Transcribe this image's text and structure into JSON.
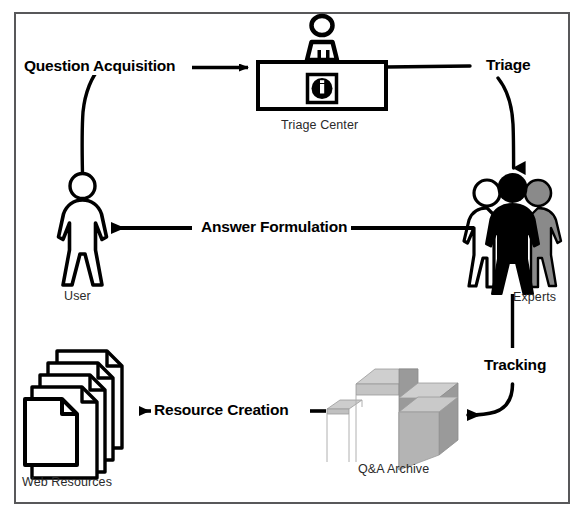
{
  "figure": {
    "border_color": "#58585a",
    "background": "#ffffff"
  },
  "nodes": [
    {
      "id": "triage-center",
      "label": "Triage Center",
      "icon": "information-desk-icon",
      "shape": "desk-with-attendant-and-info-symbol",
      "info_symbol": "i",
      "color": "#000000"
    },
    {
      "id": "experts",
      "label": "Experts",
      "icon": "three-people-icon",
      "shape": "three-person-figures",
      "colors": [
        "#ffffff",
        "#000000",
        "#808080"
      ]
    },
    {
      "id": "user",
      "label": "User",
      "icon": "person-icon",
      "shape": "single-person-figure",
      "color": "#ffffff"
    },
    {
      "id": "web-resources",
      "label": "Web Resources",
      "icon": "document-stack-icon",
      "shape": "stack-of-five-documents",
      "color": "#ffffff"
    },
    {
      "id": "qa-archive",
      "label": "Q&A Archive",
      "icon": "database-blocks-icon",
      "shape": "isometric-stair-blocks",
      "colors": [
        "#c9c9c9",
        "#9a9a9a",
        "#b5b5b5"
      ]
    }
  ],
  "edges": [
    {
      "id": "question-acquisition",
      "label": "Question Acquisition",
      "from": "user",
      "to": "triage-center",
      "arrow": "arrow-right"
    },
    {
      "id": "triage",
      "label": "Triage",
      "from": "triage-center",
      "to": "experts",
      "arrow": "arrow-down"
    },
    {
      "id": "answer-formulation",
      "label": "Answer Formulation",
      "from": "experts",
      "to": "user",
      "arrow": "arrow-left"
    },
    {
      "id": "tracking",
      "label": "Tracking",
      "from": "experts",
      "to": "qa-archive",
      "arrow": "arrow-left"
    },
    {
      "id": "resource-creation",
      "label": "Resource Creation",
      "from": "qa-archive",
      "to": "web-resources",
      "arrow": "arrow-left"
    }
  ],
  "labels": {
    "question_acquisition": "Question Acquisition",
    "triage": "Triage",
    "answer_formulation": "Answer Formulation",
    "tracking": "Tracking",
    "resource_creation": "Resource Creation",
    "triage_center": "Triage Center",
    "experts": "Experts",
    "user": "User",
    "web_resources": "Web Resources",
    "qa_archive": "Q&A Archive"
  }
}
